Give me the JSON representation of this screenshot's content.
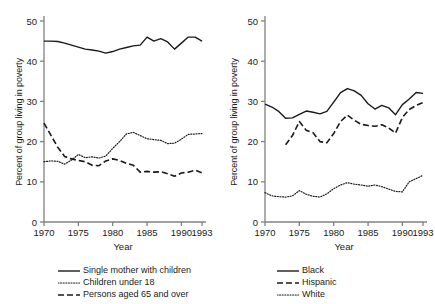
{
  "figure": {
    "axis_y_title": "Percent of group living in poverty",
    "axis_x_title": "Year"
  },
  "chart_data": [
    {
      "type": "line",
      "panel": "left",
      "title": "",
      "xlabel": "Year",
      "ylabel": "Percent of group living in poverty",
      "xlim": [
        1970,
        1993
      ],
      "ylim": [
        0,
        53
      ],
      "yticks": [
        0,
        10,
        20,
        30,
        40,
        50
      ],
      "xticks": [
        1970,
        1975,
        1980,
        1985,
        1990,
        1993
      ],
      "grid": false,
      "legend_position": "below",
      "x": [
        1970,
        1971,
        1972,
        1973,
        1974,
        1975,
        1976,
        1977,
        1978,
        1979,
        1980,
        1981,
        1982,
        1983,
        1984,
        1985,
        1986,
        1987,
        1988,
        1989,
        1990,
        1991,
        1992,
        1993
      ],
      "series": [
        {
          "name": "Single mother with children",
          "style": "solid",
          "values": [
            45.0,
            45.0,
            44.9,
            44.5,
            44.0,
            43.5,
            43.0,
            42.8,
            42.5,
            42.0,
            42.4,
            43.0,
            43.4,
            43.8,
            44.0,
            46.0,
            45.0,
            45.6,
            44.8,
            43.0,
            44.5,
            46.0,
            46.0,
            45.0
          ]
        },
        {
          "name": "Children under 18",
          "style": "dotted",
          "values": [
            15.0,
            15.2,
            15.1,
            14.4,
            15.4,
            16.8,
            16.0,
            16.2,
            15.9,
            16.4,
            18.3,
            20.0,
            21.9,
            22.3,
            21.5,
            20.7,
            20.5,
            20.3,
            19.5,
            19.6,
            20.6,
            21.8,
            21.9,
            22.0
          ]
        },
        {
          "name": "Persons aged 65 and over",
          "style": "dashed",
          "values": [
            24.6,
            21.6,
            18.6,
            16.3,
            15.7,
            15.3,
            15.0,
            14.1,
            14.0,
            15.2,
            15.7,
            15.3,
            14.6,
            14.1,
            12.4,
            12.6,
            12.4,
            12.5,
            12.0,
            11.4,
            12.2,
            12.4,
            12.9,
            12.2
          ]
        }
      ]
    },
    {
      "type": "line",
      "panel": "right",
      "title": "",
      "xlabel": "Year",
      "ylabel": "Percent of group living in poverty",
      "xlim": [
        1970,
        1993
      ],
      "ylim": [
        0,
        53
      ],
      "yticks": [
        0,
        10,
        20,
        30,
        40,
        50
      ],
      "xticks": [
        1970,
        1975,
        1980,
        1985,
        1990,
        1993
      ],
      "grid": false,
      "legend_position": "below",
      "x": [
        1970,
        1971,
        1972,
        1973,
        1974,
        1975,
        1976,
        1977,
        1978,
        1979,
        1980,
        1981,
        1982,
        1983,
        1984,
        1985,
        1986,
        1987,
        1988,
        1989,
        1990,
        1991,
        1992,
        1993
      ],
      "series": [
        {
          "name": "Black",
          "style": "solid",
          "values": [
            29.3,
            28.6,
            27.5,
            25.8,
            25.9,
            26.8,
            27.6,
            27.3,
            26.9,
            27.5,
            29.8,
            32.2,
            33.2,
            32.6,
            31.5,
            29.4,
            28.1,
            29.0,
            28.4,
            26.7,
            29.2,
            30.6,
            32.2,
            32.0
          ]
        },
        {
          "name": "Hispanic",
          "style": "dashed",
          "values": [
            null,
            null,
            null,
            19.2,
            21.5,
            25.0,
            22.8,
            22.2,
            20.0,
            19.7,
            22.0,
            25.0,
            26.6,
            25.3,
            24.3,
            24.0,
            23.8,
            24.2,
            23.4,
            22.1,
            26.0,
            28.0,
            29.0,
            29.7
          ]
        },
        {
          "name": "White",
          "style": "dotted",
          "values": [
            7.3,
            6.5,
            6.3,
            6.2,
            6.5,
            7.8,
            6.9,
            6.4,
            6.2,
            7.0,
            8.3,
            9.2,
            9.8,
            9.4,
            9.2,
            8.9,
            9.2,
            8.8,
            8.2,
            7.6,
            7.5,
            10.0,
            10.8,
            11.6
          ]
        }
      ]
    }
  ],
  "legends": {
    "left": [
      {
        "label": "Single mother with children",
        "style": "solid"
      },
      {
        "label": "Children under 18",
        "style": "dotted"
      },
      {
        "label": "Persons aged 65 and over",
        "style": "dashed"
      }
    ],
    "right": [
      {
        "label": "Black",
        "style": "solid"
      },
      {
        "label": "Hispanic",
        "style": "dashed"
      },
      {
        "label": "White",
        "style": "dotted"
      }
    ]
  }
}
